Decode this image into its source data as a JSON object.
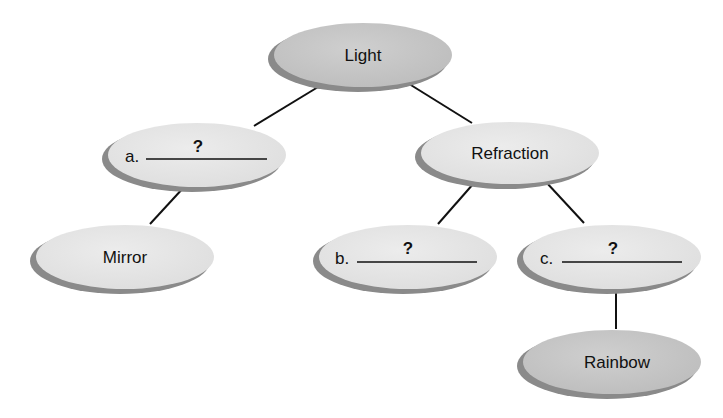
{
  "diagram": {
    "type": "concept-map",
    "colors": {
      "dark_node_fill": "#c4c4c4",
      "light_node_fill": "#e6e6e6",
      "shadow": "#8a8a8a",
      "edge": "#111111"
    },
    "nodes": {
      "light": {
        "label": "Light",
        "shade": "dark"
      },
      "a": {
        "prefix": "a.",
        "blank": "?",
        "shade": "light"
      },
      "refraction": {
        "label": "Refraction",
        "shade": "light"
      },
      "mirror": {
        "label": "Mirror",
        "shade": "light"
      },
      "b": {
        "prefix": "b.",
        "blank": "?",
        "shade": "light"
      },
      "c": {
        "prefix": "c.",
        "blank": "?",
        "shade": "light"
      },
      "rainbow": {
        "label": "Rainbow",
        "shade": "dark"
      }
    },
    "edges": [
      {
        "from": "Light",
        "to": "a"
      },
      {
        "from": "Light",
        "to": "Refraction"
      },
      {
        "from": "a",
        "to": "Mirror"
      },
      {
        "from": "Refraction",
        "to": "b"
      },
      {
        "from": "Refraction",
        "to": "c"
      },
      {
        "from": "c",
        "to": "Rainbow"
      }
    ]
  }
}
